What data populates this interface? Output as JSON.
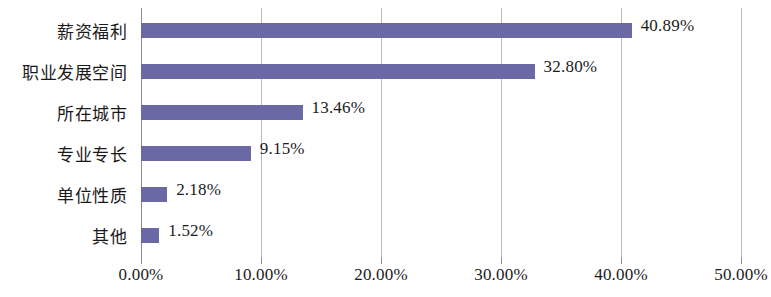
{
  "chart_data": {
    "type": "bar",
    "orientation": "horizontal",
    "title": "",
    "xlabel": "",
    "ylabel": "",
    "xlim": [
      0,
      50
    ],
    "xtick_step": 10,
    "grid": true,
    "legend": false,
    "series_color": "#6b68a6",
    "categories": [
      "薪资福利",
      "职业发展空间",
      "所在城市",
      "专业专长",
      "单位性质",
      "其他"
    ],
    "values": [
      40.89,
      32.8,
      13.46,
      9.15,
      2.18,
      1.52
    ],
    "value_labels": [
      "40.89%",
      "32.80%",
      "13.46%",
      "9.15%",
      "2.18%",
      "1.52%"
    ],
    "xtick_values": [
      0,
      10,
      20,
      30,
      40,
      50
    ],
    "xtick_labels": [
      "0.00%",
      "10.00%",
      "20.00%",
      "30.00%",
      "40.00%",
      "50.00%"
    ]
  },
  "style": {
    "background": "#ffffff",
    "bar_color": "#6b68a6",
    "gridline_color": "#b9b9bd",
    "axis_color": "#8a8a90",
    "text_color": "#1c1c1c"
  }
}
